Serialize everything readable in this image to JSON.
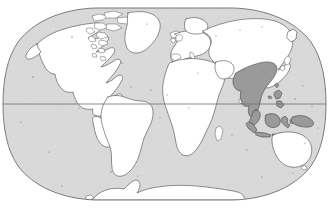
{
  "map": {
    "title": "World Map",
    "projection": "Robinson",
    "ocean_color": "#d9d9d9",
    "land_color": "#ffffff",
    "highlight_color": "#9a9a9a",
    "outline_color": "#3a3a3a",
    "frame_color": "#6e6e6e",
    "graticule": {
      "equator_visible": true,
      "equator_label": "Equator",
      "meridians_visible": false,
      "parallels_visible": false
    },
    "highlight_region": {
      "name": "Indomalayan realm",
      "label": "Southeast Asia",
      "color": "#9a9a9a",
      "countries": [
        "India (northeast)",
        "Bangladesh",
        "Myanmar",
        "Thailand",
        "Laos",
        "Cambodia",
        "Vietnam",
        "Malaysia",
        "Indonesia",
        "Philippines",
        "Papua New Guinea",
        "Brunei",
        "Singapore"
      ]
    },
    "continents": [
      {
        "name": "North America",
        "highlighted": false
      },
      {
        "name": "South America",
        "highlighted": false
      },
      {
        "name": "Greenland",
        "highlighted": false
      },
      {
        "name": "Europe",
        "highlighted": false
      },
      {
        "name": "Africa",
        "highlighted": false
      },
      {
        "name": "Asia",
        "highlighted": false
      },
      {
        "name": "Southeast Asia",
        "highlighted": true
      },
      {
        "name": "Australia",
        "highlighted": false
      },
      {
        "name": "Antarctica",
        "highlighted": false
      }
    ],
    "caption": ""
  }
}
